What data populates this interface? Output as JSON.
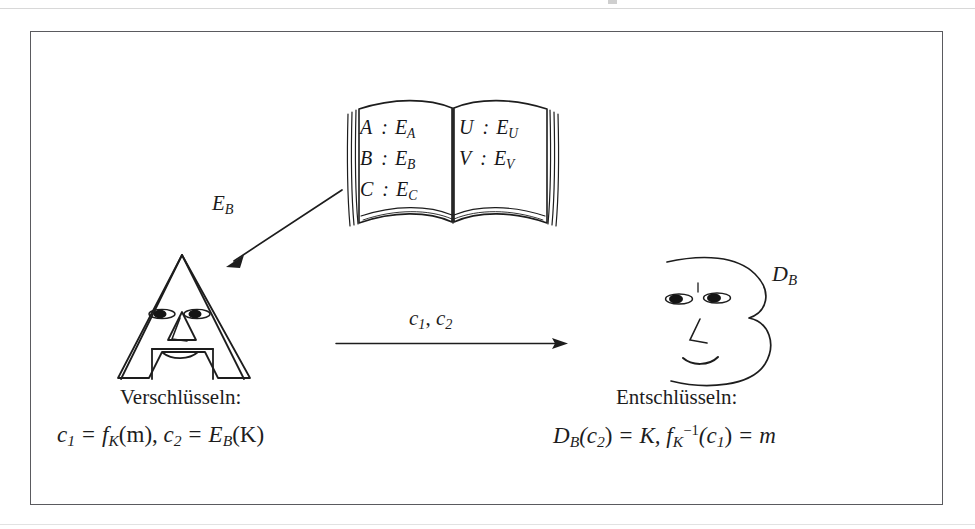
{
  "figure": {
    "border_color": "#5a5a5e",
    "ink_color": "#1d1d1d",
    "background": "#ffffff"
  },
  "book": {
    "name": "public-key-directory-book",
    "left_page": [
      {
        "id": "A",
        "sep": ":",
        "key": "E",
        "key_sub": "A"
      },
      {
        "id": "B",
        "sep": ":",
        "key": "E",
        "key_sub": "B"
      },
      {
        "id": "C",
        "sep": ":",
        "key": "E",
        "key_sub": "C"
      }
    ],
    "right_page": [
      {
        "id": "U",
        "sep": ":",
        "key": "E",
        "key_sub": "U"
      },
      {
        "id": "V",
        "sep": ":",
        "key": "E",
        "key_sub": "V"
      }
    ]
  },
  "arrows": {
    "lookup": {
      "name": "book-to-alice-arrow",
      "label": "E",
      "label_sub": "B"
    },
    "transmit": {
      "name": "alice-to-bob-arrow",
      "label": "c",
      "label_sub_1": "1",
      "label_comma": ",",
      "label_2": "c",
      "label_sub_2": "2",
      "label_full": "c1, c2"
    }
  },
  "left_party": {
    "name": "alice-letter-a-face",
    "letter": "A",
    "caption": "Verschlüsseln:",
    "formula_plain": "c1 = fK(m), c2 = EB(K)",
    "formula": {
      "t1": "c",
      "s1": "1",
      "eq1": "=",
      "t2": "f",
      "s2": "K",
      "arg1": "(m),",
      "t3": "c",
      "s3": "2",
      "eq2": "=",
      "t4": "E",
      "s4": "B",
      "arg2": "(K)"
    }
  },
  "right_party": {
    "name": "bob-letter-b-face",
    "letter": "B",
    "label": "D",
    "label_sub": "B",
    "caption": "Entschlüsseln:",
    "formula_plain": "DB(c2) = K, fK^-1(c1) = m",
    "formula": {
      "t1": "D",
      "s1": "B",
      "arg1": "(c",
      "s2": "2",
      "arg1b": ")",
      "eq1": "=",
      "t2": "K,",
      "t3": "f",
      "s3": "K",
      "sup3": "−1",
      "arg2": "(c",
      "s4": "1",
      "arg2b": ")",
      "eq2": "=",
      "t4": "m"
    }
  }
}
